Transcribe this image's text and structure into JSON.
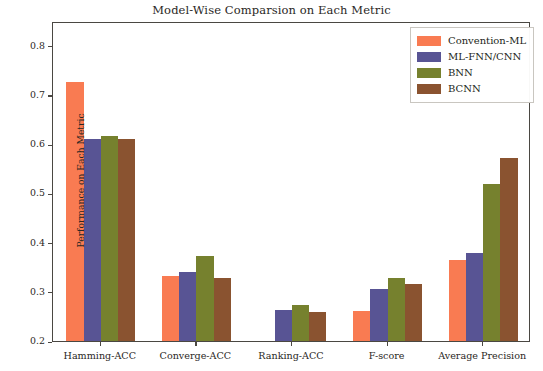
{
  "chart_data": {
    "type": "bar",
    "title": "Model-Wise Comparsion on Each Metric",
    "xlabel": "",
    "ylabel": "Performance on Each Metric",
    "categories": [
      "Hamming-ACC",
      "Converge-ACC",
      "Ranking-ACC",
      "F-score",
      "Average Precision"
    ],
    "series": [
      {
        "name": "Convention-ML",
        "color": "#F97B52",
        "values": [
          0.727,
          0.333,
          0.2,
          0.26,
          0.364
        ]
      },
      {
        "name": "ML-FNN/CNN",
        "color": "#585494",
        "values": [
          0.611,
          0.34,
          0.262,
          0.306,
          0.378
        ]
      },
      {
        "name": "BNN",
        "color": "#76812E",
        "values": [
          0.616,
          0.373,
          0.274,
          0.329,
          0.519
        ]
      },
      {
        "name": "BCNN",
        "color": "#8A5330",
        "values": [
          0.611,
          0.328,
          0.258,
          0.316,
          0.571
        ]
      }
    ],
    "ylim": [
      0.2,
      0.85
    ],
    "yticks": [
      0.2,
      0.3,
      0.4,
      0.5,
      0.6,
      0.7,
      0.8
    ],
    "ytick_labels": [
      "0.2",
      "0.3",
      "0.4",
      "0.5",
      "0.6",
      "0.7",
      "0.8"
    ],
    "grid": false,
    "legend_position": "upper right"
  }
}
